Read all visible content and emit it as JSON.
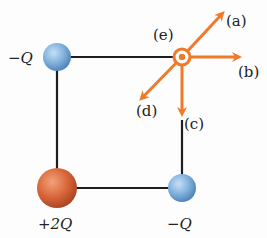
{
  "diagram": {
    "type": "electric-charges-square",
    "charges": [
      {
        "id": "top-left",
        "label": "−Q",
        "sign": "negative",
        "color": "#7fb0dc"
      },
      {
        "id": "bottom-left",
        "label": "+2Q",
        "sign": "positive",
        "color": "#d9663a"
      },
      {
        "id": "bottom-right",
        "label": "−Q",
        "sign": "negative",
        "color": "#7fb0dc"
      }
    ],
    "point": {
      "label": "(e)",
      "note": "out of page"
    },
    "arrows": [
      {
        "id": "a",
        "label": "(a)",
        "direction": "up-right"
      },
      {
        "id": "b",
        "label": "(b)",
        "direction": "right"
      },
      {
        "id": "c",
        "label": "(c)",
        "direction": "down"
      },
      {
        "id": "d",
        "label": "(d)",
        "direction": "down-left"
      }
    ],
    "arrow_color": "#f07a2a",
    "line_color": "#1e1e1e"
  }
}
